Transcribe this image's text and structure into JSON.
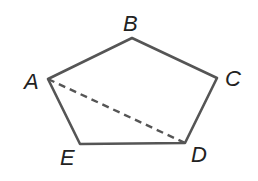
{
  "diagram": {
    "type": "pentagon",
    "vertices": [
      {
        "name": "A",
        "x": 48,
        "y": 79,
        "label_x": 24,
        "label_y": 89
      },
      {
        "name": "B",
        "x": 132,
        "y": 38,
        "label_x": 123,
        "label_y": 31
      },
      {
        "name": "C",
        "x": 217,
        "y": 78,
        "label_x": 225,
        "label_y": 86
      },
      {
        "name": "D",
        "x": 185,
        "y": 143,
        "label_x": 191,
        "label_y": 162
      },
      {
        "name": "E",
        "x": 80,
        "y": 144,
        "label_x": 60,
        "label_y": 165
      }
    ],
    "edges": [
      {
        "from": "A",
        "to": "B",
        "style": "solid"
      },
      {
        "from": "B",
        "to": "C",
        "style": "solid"
      },
      {
        "from": "C",
        "to": "D",
        "style": "solid"
      },
      {
        "from": "D",
        "to": "E",
        "style": "solid"
      },
      {
        "from": "E",
        "to": "A",
        "style": "solid"
      }
    ],
    "diagonals": [
      {
        "from": "A",
        "to": "D",
        "style": "dashed"
      }
    ],
    "line_color": "#555555",
    "label_color": "#222222"
  }
}
